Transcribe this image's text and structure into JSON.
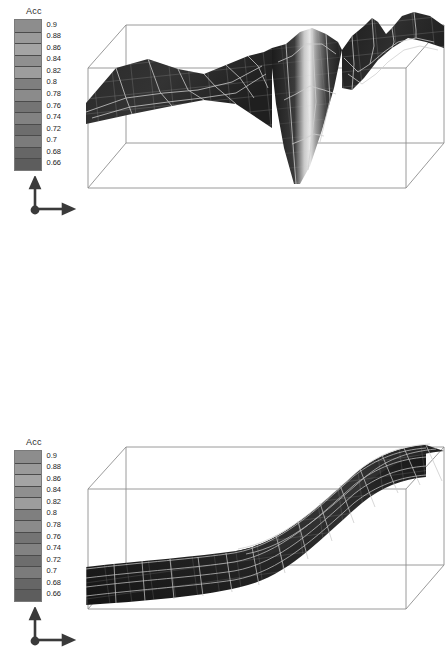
{
  "figure": {
    "background_color": "#ffffff",
    "panel_count": 2,
    "colormap": "grayscale",
    "wireframe_color": "#b9b9b9",
    "box_line_color": "#8e8e8e"
  },
  "legend": {
    "title": "Acc",
    "ticks": [
      "0.9",
      "0.88",
      "0.86",
      "0.84",
      "0.82",
      "0.8",
      "0.78",
      "0.76",
      "0.74",
      "0.72",
      "0.7",
      "0.68",
      "0.66"
    ],
    "min": 0.66,
    "max": 0.9,
    "step": 0.02,
    "swatch_colors": [
      "#8d8d8d",
      "#9a9a9a",
      "#a4a4a4",
      "#8f8f8f",
      "#9d9d9d",
      "#7f7f7f",
      "#8b8b8b",
      "#747474",
      "#828282",
      "#6d6d6d",
      "#7b7b7b",
      "#666666",
      "#5d5d5d"
    ]
  },
  "axis_triad": {
    "name": "axis-triad",
    "vertical_axis_label": "",
    "horizontal_axis_label": "",
    "depth_axis_label": ""
  },
  "chart_data": [
    {
      "type": "surface",
      "panel": "top",
      "title": "",
      "xlabel": "",
      "ylabel": "",
      "zlabel": "Acc",
      "colorbar_label": "Acc",
      "zlim": [
        0.66,
        0.9
      ],
      "grid": true,
      "legend_position": "left",
      "description": "Rough accuracy loss-landscape surface with a deep narrow V-shaped valley near the center and jagged ridges toward the right edge.",
      "surface_silhouette_top": [
        [
          0,
          64
        ],
        [
          22,
          58
        ],
        [
          46,
          50
        ],
        [
          70,
          42
        ],
        [
          92,
          40
        ],
        [
          112,
          44
        ],
        [
          132,
          40
        ],
        [
          150,
          34
        ],
        [
          168,
          28
        ],
        [
          180,
          22
        ],
        [
          190,
          20
        ],
        [
          200,
          22
        ],
        [
          210,
          26
        ],
        [
          222,
          24
        ],
        [
          234,
          18
        ],
        [
          246,
          14
        ],
        [
          256,
          16
        ],
        [
          266,
          22
        ],
        [
          276,
          18
        ],
        [
          286,
          10
        ],
        [
          296,
          12
        ],
        [
          308,
          18
        ],
        [
          320,
          14
        ],
        [
          332,
          8
        ],
        [
          344,
          12
        ],
        [
          356,
          20
        ]
      ],
      "valley": {
        "center_x_frac": 0.52,
        "depth_frac": 1.0,
        "highlight": true
      }
    },
    {
      "type": "surface",
      "panel": "bottom",
      "title": "",
      "xlabel": "",
      "ylabel": "",
      "zlabel": "Acc",
      "colorbar_label": "Acc",
      "zlim": [
        0.66,
        0.9
      ],
      "grid": true,
      "legend_position": "left",
      "description": "Smooth monotonic sigmoid ramp surface, flat and low on the left half then rising steeply to a flat high plateau on the right.",
      "ramp_profile": [
        [
          0.0,
          0.02
        ],
        [
          0.1,
          0.02
        ],
        [
          0.2,
          0.03
        ],
        [
          0.3,
          0.05
        ],
        [
          0.4,
          0.09
        ],
        [
          0.5,
          0.2
        ],
        [
          0.58,
          0.36
        ],
        [
          0.66,
          0.56
        ],
        [
          0.74,
          0.76
        ],
        [
          0.82,
          0.9
        ],
        [
          0.9,
          0.97
        ],
        [
          1.0,
          1.0
        ]
      ]
    }
  ]
}
